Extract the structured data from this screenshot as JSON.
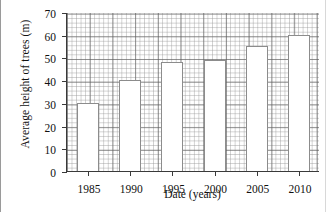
{
  "chart_data": {
    "type": "bar",
    "title": "",
    "xlabel": "Date (years)",
    "ylabel": "Average height of trees (m)",
    "categories": [
      "1985",
      "1990",
      "1995",
      "2000",
      "2005",
      "2010"
    ],
    "values": [
      30,
      40,
      48,
      49,
      55,
      60
    ],
    "ylim": [
      0,
      70
    ],
    "ytick_labels": [
      "0",
      "10",
      "20",
      "30",
      "40",
      "50",
      "60",
      "70"
    ],
    "ytick_values": [
      0,
      10,
      20,
      30,
      40,
      50,
      60,
      70
    ],
    "xtick_labels": [
      "1985",
      "1990",
      "1995",
      "2000",
      "2005",
      "2010"
    ],
    "grid": true,
    "grid_minor_step": 2,
    "grid_major_step": 10,
    "legend": null,
    "bar_fill_color": "#ffffff",
    "bar_edge_color": "#8c8c8c",
    "axis_color": "#3a3a3a",
    "grid_color": "#5a5a5a",
    "background_color": "#ffffff"
  }
}
